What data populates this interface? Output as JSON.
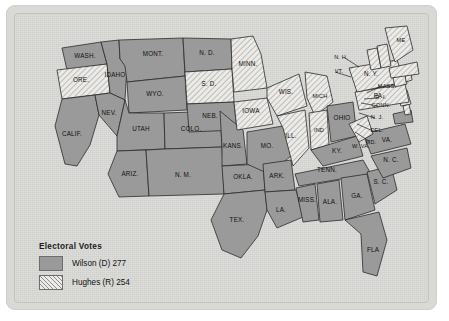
{
  "map": {
    "title": "1916 United States presidential election electoral map",
    "legend": {
      "title": "Electoral Votes",
      "entries": [
        {
          "key": "wilson",
          "label": "Wilson (D) 277",
          "swatch": "solid-gray",
          "color": "#9a9a9a",
          "votes": 277,
          "candidate": "Wilson",
          "party": "D"
        },
        {
          "key": "hughes",
          "label": "Hughes (R) 254",
          "swatch": "hatched",
          "color": "#eceae6",
          "votes": 254,
          "candidate": "Hughes",
          "party": "R"
        }
      ]
    },
    "states": [
      {
        "id": "wash",
        "label": "WASH.",
        "winner": "wilson"
      },
      {
        "id": "ore",
        "label": "ORE.",
        "winner": "hughes"
      },
      {
        "id": "calif",
        "label": "CALIF.",
        "winner": "wilson"
      },
      {
        "id": "idaho",
        "label": "IDAHO",
        "winner": "wilson"
      },
      {
        "id": "nev",
        "label": "NEV.",
        "winner": "wilson"
      },
      {
        "id": "mont",
        "label": "MONT.",
        "winner": "wilson"
      },
      {
        "id": "wyo",
        "label": "WYO.",
        "winner": "wilson"
      },
      {
        "id": "utah",
        "label": "UTAH",
        "winner": "wilson"
      },
      {
        "id": "ariz",
        "label": "ARIZ.",
        "winner": "wilson"
      },
      {
        "id": "colo",
        "label": "COLO.",
        "winner": "wilson"
      },
      {
        "id": "nmex",
        "label": "N. M.",
        "winner": "wilson"
      },
      {
        "id": "nd",
        "label": "N. D.",
        "winner": "wilson"
      },
      {
        "id": "sd",
        "label": "S. D.",
        "winner": "hughes"
      },
      {
        "id": "neb",
        "label": "NEB.",
        "winner": "wilson"
      },
      {
        "id": "kans",
        "label": "KANS.",
        "winner": "wilson"
      },
      {
        "id": "okla",
        "label": "OKLA.",
        "winner": "wilson"
      },
      {
        "id": "tex",
        "label": "TEX.",
        "winner": "wilson"
      },
      {
        "id": "minn",
        "label": "MINN.",
        "winner": "hughes"
      },
      {
        "id": "iowa",
        "label": "IOWA",
        "winner": "hughes"
      },
      {
        "id": "mo",
        "label": "MO.",
        "winner": "wilson"
      },
      {
        "id": "ark",
        "label": "ARK.",
        "winner": "wilson"
      },
      {
        "id": "la",
        "label": "LA.",
        "winner": "wilson"
      },
      {
        "id": "wis",
        "label": "WIS.",
        "winner": "hughes"
      },
      {
        "id": "ill",
        "label": "ILL.",
        "winner": "hughes"
      },
      {
        "id": "mich",
        "label": "MICH",
        "winner": "hughes"
      },
      {
        "id": "ind",
        "label": "IND",
        "winner": "hughes"
      },
      {
        "id": "ohio",
        "label": "OHIO",
        "winner": "wilson"
      },
      {
        "id": "ky",
        "label": "KY.",
        "winner": "wilson"
      },
      {
        "id": "tenn",
        "label": "TENN.",
        "winner": "wilson"
      },
      {
        "id": "miss",
        "label": "MISS.",
        "winner": "wilson"
      },
      {
        "id": "ala",
        "label": "ALA.",
        "winner": "wilson"
      },
      {
        "id": "ga",
        "label": "GA.",
        "winner": "wilson"
      },
      {
        "id": "fla",
        "label": "FLA",
        "winner": "wilson"
      },
      {
        "id": "sc",
        "label": "S. C.",
        "winner": "wilson"
      },
      {
        "id": "nc",
        "label": "N. C.",
        "winner": "wilson"
      },
      {
        "id": "va",
        "label": "VA.",
        "winner": "wilson"
      },
      {
        "id": "wva",
        "label": "W. VA.",
        "winner": "hughes"
      },
      {
        "id": "md",
        "label": "MD.",
        "winner": "wilson"
      },
      {
        "id": "del",
        "label": "DEL.",
        "winner": "hughes"
      },
      {
        "id": "nj",
        "label": "N. J.",
        "winner": "hughes"
      },
      {
        "id": "pa",
        "label": "PA.",
        "winner": "hughes"
      },
      {
        "id": "ny",
        "label": "N. Y.",
        "winner": "hughes"
      },
      {
        "id": "conn",
        "label": "CONN.",
        "winner": "hughes"
      },
      {
        "id": "ri",
        "label": "R. I.",
        "winner": "hughes"
      },
      {
        "id": "mass",
        "label": "MASS.",
        "winner": "hughes"
      },
      {
        "id": "vt",
        "label": "VT.",
        "winner": "hughes"
      },
      {
        "id": "nh",
        "label": "N. H.",
        "winner": "hughes"
      },
      {
        "id": "me",
        "label": "ME",
        "winner": "hughes"
      }
    ]
  }
}
